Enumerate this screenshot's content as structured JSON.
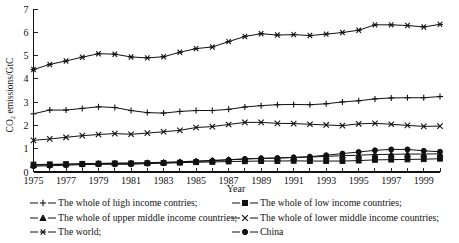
{
  "chart_data": {
    "type": "line",
    "title": "",
    "xlabel": "Year",
    "ylabel": "CO2 emissions/GtC",
    "ylabel_display": "CO₂ emissions/GtC",
    "xlim": [
      1975,
      2000
    ],
    "ylim": [
      0,
      7
    ],
    "ytick_values": [
      0,
      1,
      2,
      3,
      4,
      5,
      6,
      7
    ],
    "ytick_labels": [
      "0",
      "1",
      "2",
      "3",
      "4",
      "5",
      "6",
      "7"
    ],
    "xtick_values": [
      1975,
      1976,
      1977,
      1978,
      1979,
      1980,
      1981,
      1982,
      1983,
      1984,
      1985,
      1986,
      1987,
      1988,
      1989,
      1990,
      1991,
      1992,
      1993,
      1994,
      1995,
      1996,
      1997,
      1998,
      1999,
      2000
    ],
    "xtick_labels_shown": [
      "1975",
      "1977",
      "1979",
      "1981",
      "1983",
      "1985",
      "1987",
      "1989",
      "1991",
      "1993",
      "1995",
      "1997",
      "1999"
    ],
    "grid": false,
    "legend_position": "below-axes",
    "x": [
      1975,
      1976,
      1977,
      1978,
      1979,
      1980,
      1981,
      1982,
      1983,
      1984,
      1985,
      1986,
      1987,
      1988,
      1989,
      1990,
      1991,
      1992,
      1993,
      1994,
      1995,
      1996,
      1997,
      1998,
      1999,
      2000
    ],
    "series": [
      {
        "name": "The world;",
        "marker": "asterisk",
        "values": [
          4.4,
          4.62,
          4.77,
          4.93,
          5.08,
          5.06,
          4.94,
          4.9,
          4.95,
          5.14,
          5.3,
          5.37,
          5.6,
          5.82,
          5.94,
          5.88,
          5.9,
          5.86,
          5.92,
          5.99,
          6.09,
          6.32,
          6.32,
          6.29,
          6.23,
          6.34
        ]
      },
      {
        "name": "The whole of high income contries;",
        "marker": "plus",
        "values": [
          2.5,
          2.66,
          2.66,
          2.73,
          2.8,
          2.77,
          2.64,
          2.55,
          2.53,
          2.6,
          2.64,
          2.64,
          2.69,
          2.79,
          2.85,
          2.89,
          2.9,
          2.89,
          2.93,
          3.01,
          3.06,
          3.14,
          3.18,
          3.19,
          3.19,
          3.24
        ]
      },
      {
        "name": "The whole of lower middle income countries;",
        "marker": "cross",
        "values": [
          1.36,
          1.42,
          1.49,
          1.56,
          1.61,
          1.65,
          1.62,
          1.67,
          1.73,
          1.79,
          1.91,
          1.95,
          2.04,
          2.13,
          2.13,
          2.09,
          2.08,
          2.05,
          2.02,
          1.99,
          2.07,
          2.09,
          2.05,
          2.0,
          1.96,
          1.97
        ]
      },
      {
        "name": "China",
        "marker": "circle",
        "values": [
          0.25,
          0.27,
          0.29,
          0.32,
          0.33,
          0.33,
          0.33,
          0.36,
          0.38,
          0.41,
          0.45,
          0.48,
          0.52,
          0.56,
          0.59,
          0.6,
          0.63,
          0.66,
          0.72,
          0.79,
          0.86,
          0.93,
          0.97,
          0.97,
          0.91,
          0.87
        ]
      },
      {
        "name": "The whole of low income countries;",
        "marker": "square",
        "values": [
          0.32,
          0.33,
          0.34,
          0.35,
          0.36,
          0.37,
          0.37,
          0.38,
          0.39,
          0.4,
          0.42,
          0.43,
          0.45,
          0.46,
          0.47,
          0.47,
          0.48,
          0.47,
          0.47,
          0.47,
          0.49,
          0.52,
          0.53,
          0.54,
          0.55,
          0.57
        ]
      },
      {
        "name": "The whole of upper middle income countries;",
        "marker": "triangle",
        "values": [
          0.29,
          0.31,
          0.33,
          0.35,
          0.37,
          0.38,
          0.39,
          0.4,
          0.42,
          0.44,
          0.47,
          0.5,
          0.53,
          0.56,
          0.58,
          0.6,
          0.62,
          0.64,
          0.67,
          0.7,
          0.72,
          0.75,
          0.76,
          0.77,
          0.77,
          0.78
        ]
      }
    ]
  },
  "legend": {
    "rows": [
      {
        "left": {
          "label": "The whole of high income contries;",
          "marker": "plus"
        },
        "right": {
          "label": "The whole of low income countries;",
          "marker": "square"
        }
      },
      {
        "left": {
          "label": "The whole of upper middle income countries;",
          "marker": "triangle"
        },
        "right": {
          "label": "The whole of lower middle income countries;",
          "marker": "cross"
        }
      },
      {
        "left": {
          "label": "The world;",
          "marker": "asterisk"
        },
        "right": {
          "label": "China",
          "marker": "circle"
        }
      }
    ]
  },
  "axes": {
    "x_title": "Year",
    "y_title": "CO₂ emissions/GtC"
  },
  "colors": {
    "ink": "#111111",
    "background": "#ffffff"
  }
}
